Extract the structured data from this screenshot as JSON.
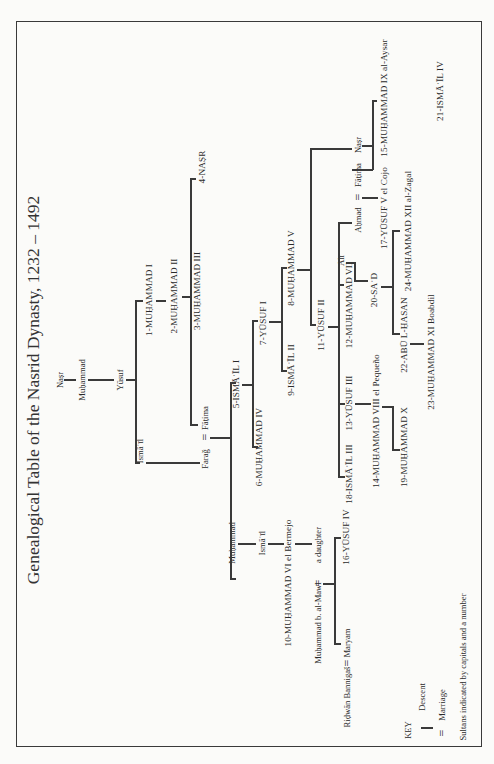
{
  "title": "Genealogical Table of the Nasrid Dynasty, 1232 – 1492",
  "labels": {
    "nasr_root": "Naṣr",
    "muhammad_a": "Muḥammad",
    "yusuf_a": "Yūsuf",
    "ismail_a": "Ismāʿīl",
    "s1": "1-MUḤAMMAD I",
    "s2": "2-MUḤAMMAD II",
    "s3": "3-MUḤAMMAD III",
    "s4": "4-NAṢR",
    "faraj": "Faraǧ",
    "fatima_a": "Fāṭima",
    "s5": "5-ISMĀʿĪL I",
    "s6": "6-MUḤAMMAD IV",
    "s7": "7-YŪSUF I",
    "s8": "8-MUḤAMMAD V",
    "s9": "9-ISMĀʿĪL II",
    "muhammad_b": "Muḥammad",
    "ismail_b": "Ismāʿīl",
    "s10": "10-MUḤAMMAD VI el Bermejo",
    "a_daughter": "a daughter",
    "muhammad_mawl": "Muḥammad b. al-Mawl",
    "s16": "16-YŪSUF IV",
    "maryam": "Maryam",
    "ridwan": "Riḍwān Bannigaš",
    "s11": "11-YŪSUF II",
    "s12": "12-MUḤAMMAD VII",
    "s13": "13-YŪSUF III",
    "s18": "18-ISMĀʿĪL III",
    "s14": "14-MUḤAMMAD VIII el Pequeño",
    "s19": "19-MUḤAMMAD X",
    "nasr_b": "Naṣr",
    "s15": "15-MUḤAMMAD IX al-Aysar",
    "s21": "21-ISMĀʿĪL IV",
    "fatima_b": "Fāṭima",
    "ahmad": "Aḥmad",
    "s17": "17-YŪSUF V el Cojo",
    "ali": "ʿAlī",
    "s20": "20-SAʿD",
    "s24": "24-MUḤAMMAD XII al-Zagal",
    "s22": "22-ABŪ L-ḤASAN",
    "s23": "23-MUḤAMMAD XI Boabdil",
    "marriage_sign": "="
  },
  "key": {
    "heading": "KEY",
    "descent": "Descent",
    "marriage": "Marriage",
    "marriage_symbol": "=",
    "note": "Sultans indicated by capitals and a number"
  },
  "colors": {
    "ink": "#3a3a3a",
    "paper": "#fbfbf9"
  }
}
